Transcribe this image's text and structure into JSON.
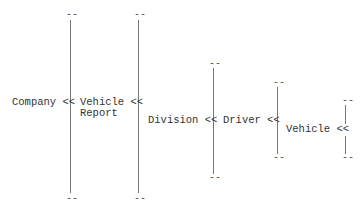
{
  "diagram": {
    "type": "nesting-hierarchy",
    "bracket_dash": "--",
    "nodes": {
      "company": "Company <<",
      "vehicle_report_1": "Vehicle <<",
      "vehicle_report_2": "Report",
      "division": "Division <<",
      "driver": "Driver <<",
      "vehicle": "Vehicle <<"
    },
    "hierarchy": [
      "Company",
      "Vehicle Report",
      "Division",
      "Driver",
      "Vehicle"
    ]
  }
}
